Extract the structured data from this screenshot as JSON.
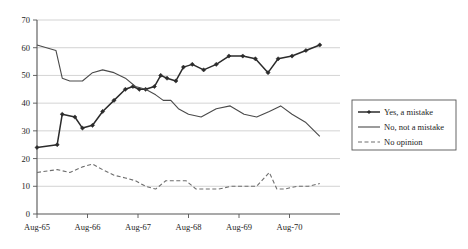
{
  "chart_data": {
    "type": "line",
    "title": "",
    "xlabel": "",
    "ylabel": "",
    "ylim": [
      0,
      70
    ],
    "ytick_step": 10,
    "yticks": [
      "0",
      "10",
      "20",
      "30",
      "40",
      "50",
      "60",
      "70"
    ],
    "xtick_labels": [
      "Aug-65",
      "Aug-66",
      "Aug-67",
      "Aug-68",
      "Aug-69",
      "Aug-70"
    ],
    "grid": "horizontal",
    "legend_position": "right",
    "x_range": [
      0,
      24
    ],
    "xtick_positions": [
      0,
      4,
      8,
      12,
      16,
      20
    ],
    "series": [
      {
        "name": "Yes, a mistake",
        "marker": "diamond",
        "dash": "solid",
        "color": "#2b2b2b",
        "x": [
          0,
          1.6,
          2.0,
          3.0,
          3.6,
          4.4,
          5.2,
          6.1,
          7.0,
          7.6,
          8.1,
          8.6,
          9.3,
          9.8,
          10.3,
          11.0,
          11.6,
          12.3,
          13.2,
          14.2,
          15.2,
          16.3,
          17.3,
          18.3,
          19.1,
          20.2,
          21.3,
          22.4
        ],
        "values": [
          24,
          25,
          36,
          35,
          31,
          32,
          37,
          41,
          45,
          46,
          45,
          45,
          46,
          50,
          49,
          48,
          53,
          54,
          52,
          54,
          57,
          57,
          56,
          51,
          56,
          57,
          59,
          61
        ]
      },
      {
        "name": "No, not a mistake",
        "marker": "none",
        "dash": "solid",
        "color": "#4a4a4a",
        "x": [
          0,
          1.5,
          2.0,
          2.6,
          3.6,
          4.4,
          5.2,
          6.1,
          7.0,
          7.8,
          8.6,
          9.4,
          10.0,
          10.6,
          11.2,
          12.0,
          13.0,
          14.2,
          15.3,
          16.4,
          17.4,
          18.4,
          19.3,
          20.2,
          21.3,
          22.4
        ],
        "values": [
          61,
          59,
          49,
          48,
          48,
          51,
          52,
          51,
          49,
          46,
          45,
          43,
          41,
          41,
          38,
          36,
          35,
          38,
          39,
          36,
          35,
          37,
          39,
          36,
          33,
          28
        ]
      },
      {
        "name": "No opinion",
        "marker": "none",
        "dash": "dashed",
        "color": "#6e6e6e",
        "x": [
          0,
          1.6,
          2.6,
          3.6,
          4.4,
          5.2,
          6.1,
          7.0,
          7.8,
          8.6,
          9.4,
          10.2,
          11.0,
          11.8,
          12.6,
          13.4,
          14.4,
          15.4,
          16.4,
          17.4,
          18.4,
          19.0,
          19.6,
          20.6,
          21.5,
          22.4
        ],
        "values": [
          15,
          16,
          15,
          17,
          18,
          16,
          14,
          13,
          12,
          10,
          9,
          12,
          12,
          12,
          9,
          9,
          9,
          10,
          10,
          10,
          15,
          9,
          9,
          10,
          10,
          11
        ]
      }
    ]
  },
  "legend": {
    "items": [
      {
        "label": "Yes, a mistake"
      },
      {
        "label": "No, not a mistake"
      },
      {
        "label": "No opinion"
      }
    ]
  }
}
